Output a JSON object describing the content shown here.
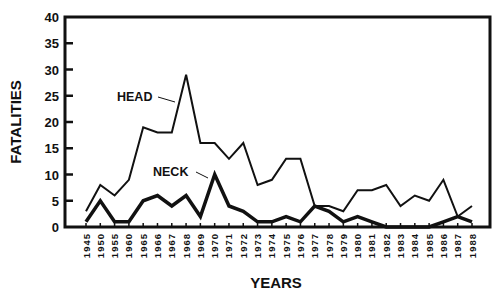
{
  "chart_data": {
    "type": "line",
    "title": "",
    "xlabel": "YEARS",
    "ylabel": "FATALITIES",
    "ylim": [
      0,
      40
    ],
    "yticks": [
      0,
      5,
      10,
      15,
      20,
      25,
      30,
      35,
      40
    ],
    "grid": false,
    "legend": "none",
    "categories": [
      "1945",
      "1950",
      "1955",
      "1960",
      "1965",
      "1966",
      "1967",
      "1968",
      "1969",
      "1970",
      "1971",
      "1972",
      "1973",
      "1974",
      "1975",
      "1976",
      "1977",
      "1978",
      "1979",
      "1980",
      "1981",
      "1982",
      "1983",
      "1984",
      "1985",
      "1986",
      "1987",
      "1988"
    ],
    "series": [
      {
        "name": "HEAD",
        "values": [
          3,
          8,
          6,
          9,
          19,
          18,
          18,
          29,
          16,
          16,
          13,
          16,
          8,
          9,
          13,
          13,
          4,
          4,
          3,
          7,
          7,
          8,
          4,
          6,
          5,
          9,
          2,
          4
        ]
      },
      {
        "name": "NECK",
        "values": [
          1,
          5,
          1,
          1,
          5,
          6,
          4,
          6,
          2,
          10,
          4,
          3,
          1,
          1,
          2,
          1,
          4,
          3,
          1,
          2,
          1,
          0,
          0,
          0,
          0,
          1,
          2,
          1
        ]
      }
    ],
    "annotations": [
      {
        "text": "HEAD",
        "series": "HEAD"
      },
      {
        "text": "NECK",
        "series": "NECK"
      }
    ]
  }
}
